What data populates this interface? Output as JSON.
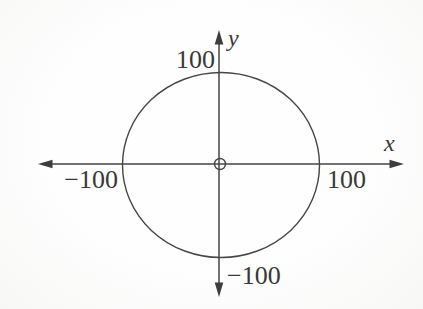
{
  "figure": {
    "x_axis_label": "x",
    "y_axis_label": "y",
    "ticks": {
      "x_positive": "100",
      "x_negative": "−100",
      "y_positive": "100",
      "y_negative": "−100"
    },
    "circle": {
      "center_x": 0,
      "center_y": 0,
      "radius": 100
    },
    "origin_marker_icon": "open-circle-at-origin",
    "colors": {
      "line": "#454545",
      "arrow": "#3d3d3d",
      "label": "#383838",
      "background": "#fdfdfc"
    }
  }
}
